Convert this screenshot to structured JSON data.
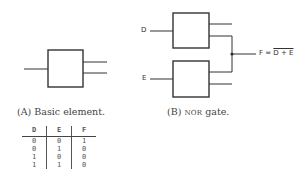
{
  "figure_a": {
    "caption_prefix": "(A) Basic element.",
    "element": "basic-element"
  },
  "figure_b": {
    "caption_open": "(B) ",
    "caption_sc": "NOR",
    "caption_rest": " gate.",
    "inputs": {
      "top": "D",
      "bottom": "E"
    },
    "output_formula": {
      "lhs": "F = ",
      "rhs_overlined": "D + E"
    }
  },
  "truth_table": {
    "headers": [
      "D",
      "E",
      "F"
    ],
    "rows": [
      [
        "0",
        "0",
        "1"
      ],
      [
        "0",
        "1",
        "0"
      ],
      [
        "1",
        "0",
        "0"
      ],
      [
        "1",
        "1",
        "0"
      ]
    ]
  },
  "colors": {
    "line": "#333333",
    "text": "#444444",
    "background": "#ffffff"
  }
}
